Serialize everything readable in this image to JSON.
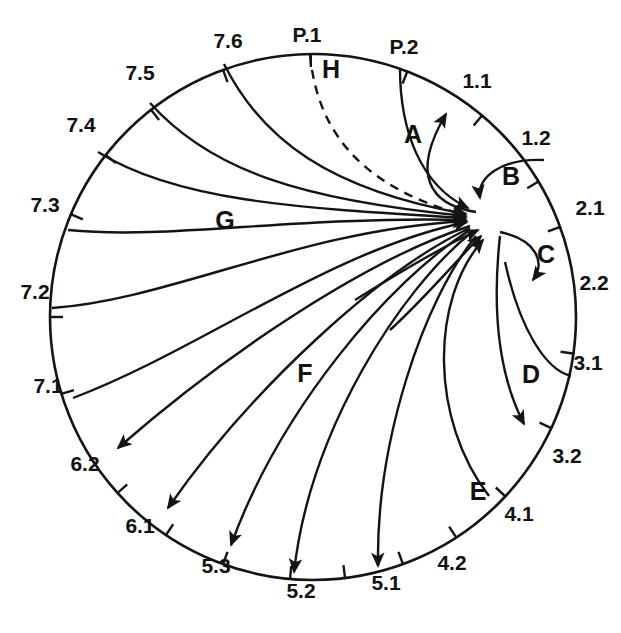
{
  "diagram": {
    "type": "circular-flow-arc-diagram",
    "geometry": {
      "center_x": 313,
      "center_y": 317,
      "radius": 263,
      "hub_x": 493,
      "hub_y": 222
    },
    "node_labels": [
      {
        "id": "P.1",
        "text": "P.1",
        "x": 307,
        "y": 42,
        "anchor": "middle",
        "tick_angle": -90.5
      },
      {
        "id": "P.2",
        "text": "P.2",
        "x": 404,
        "y": 54,
        "anchor": "middle",
        "tick_angle": -69
      },
      {
        "id": "1.1",
        "text": "1.1",
        "x": 477,
        "y": 88,
        "anchor": "middle",
        "tick_angle": -50
      },
      {
        "id": "1.2",
        "text": "1.2",
        "x": 536,
        "y": 145,
        "anchor": "middle",
        "tick_angle": -31
      },
      {
        "id": "2.1",
        "text": "2.1",
        "x": 590,
        "y": 215,
        "anchor": "middle",
        "tick_angle": -20
      },
      {
        "id": "2.2",
        "text": "2.2",
        "x": 594,
        "y": 290,
        "anchor": "middle",
        "tick_angle": 8
      },
      {
        "id": "3.1",
        "text": "3.1",
        "x": 588,
        "y": 370,
        "anchor": "middle",
        "tick_angle": 25
      },
      {
        "id": "3.2",
        "text": "3.2",
        "x": 567,
        "y": 463,
        "anchor": "middle",
        "tick_angle": 43
      },
      {
        "id": "4.1",
        "text": "4.1",
        "x": 519,
        "y": 521,
        "anchor": "middle",
        "tick_angle": 57
      },
      {
        "id": "4.2",
        "text": "4.2",
        "x": 452,
        "y": 570,
        "anchor": "middle",
        "tick_angle": 70
      },
      {
        "id": "5.1",
        "text": "5.1",
        "x": 386,
        "y": 590,
        "anchor": "middle",
        "tick_angle": 83
      },
      {
        "id": "5.2",
        "text": "5.2",
        "x": 301,
        "y": 598,
        "anchor": "middle",
        "tick_angle": 95
      },
      {
        "id": "5.3",
        "text": "5.3",
        "x": 216,
        "y": 573,
        "anchor": "middle",
        "tick_angle": 110
      },
      {
        "id": "6.1",
        "text": "6.1",
        "x": 140,
        "y": 533,
        "anchor": "middle",
        "tick_angle": 124
      },
      {
        "id": "6.2",
        "text": "6.2",
        "x": 85,
        "y": 471,
        "anchor": "middle",
        "tick_angle": 138
      },
      {
        "id": "7.1",
        "text": "7.1",
        "x": 48,
        "y": 393,
        "anchor": "middle",
        "tick_angle": 163
      },
      {
        "id": "7.2",
        "text": "7.2",
        "x": 35,
        "y": 299,
        "anchor": "middle",
        "tick_angle": 180
      },
      {
        "id": "7.3",
        "text": "7.3",
        "x": 45,
        "y": 212,
        "anchor": "middle",
        "tick_angle": -157
      },
      {
        "id": "7.4",
        "text": "7.4",
        "x": 81,
        "y": 132,
        "anchor": "middle",
        "tick_angle": -142
      },
      {
        "id": "7.5",
        "text": "7.5",
        "x": 140,
        "y": 80,
        "anchor": "middle",
        "tick_angle": -128
      },
      {
        "id": "7.6",
        "text": "7.6",
        "x": 228,
        "y": 48,
        "anchor": "middle",
        "tick_angle": -110
      }
    ],
    "flow_labels": [
      {
        "id": "A",
        "text": "A",
        "x": 413,
        "y": 143
      },
      {
        "id": "B",
        "text": "B",
        "x": 511,
        "y": 185
      },
      {
        "id": "C",
        "text": "C",
        "x": 546,
        "y": 263
      },
      {
        "id": "D",
        "text": "D",
        "x": 531,
        "y": 383
      },
      {
        "id": "E",
        "text": "E",
        "x": 478,
        "y": 500
      },
      {
        "id": "F",
        "text": "F",
        "x": 305,
        "y": 382
      },
      {
        "id": "G",
        "text": "G",
        "x": 225,
        "y": 229
      },
      {
        "id": "H",
        "text": "H",
        "x": 331,
        "y": 78
      }
    ],
    "flows": [
      {
        "id": "A",
        "from": "2.1",
        "to": "1.1",
        "direction": "outward",
        "style": "solid",
        "arrow": true
      },
      {
        "id": "B",
        "from": "1.2",
        "to": "2.1",
        "direction": "inward",
        "style": "solid",
        "arrow": true
      },
      {
        "id": "C",
        "from": "2.1",
        "to": "2.2",
        "direction": "outward",
        "style": "solid",
        "arrow": true
      },
      {
        "id": "D",
        "from": "3.1",
        "to": "3.2",
        "direction": "outward",
        "style": "solid",
        "arrow": true
      },
      {
        "id": "E",
        "from": "4.1",
        "to": "2.1",
        "direction": "inward",
        "style": "solid",
        "arrow": true
      },
      {
        "id": "F",
        "from": "2.1",
        "to": "5.1",
        "direction": "outward",
        "style": "solid",
        "arrow": true
      },
      {
        "id": "G",
        "from": "7.3",
        "to": "2.1",
        "direction": "inward",
        "style": "solid",
        "arrow": true
      },
      {
        "id": "H",
        "from": "P.1",
        "to": "2.1",
        "direction": "inward",
        "style": "dashed",
        "arrow": true
      }
    ],
    "colors": {
      "stroke": "#141414",
      "background": "#ffffff",
      "text": "#111111"
    }
  }
}
